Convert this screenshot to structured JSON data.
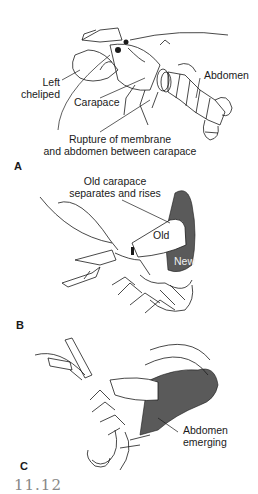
{
  "figure": {
    "number": "11.12",
    "colors": {
      "line": "#1a1a1a",
      "new_shell": "#5a5a5a",
      "background": "#ffffff"
    }
  },
  "panels": [
    {
      "letter": "A",
      "labels": {
        "left_cheliped": [
          "Left",
          "cheliped"
        ],
        "carapace": "Carapace",
        "abdomen": "Abdomen",
        "rupture": [
          "Rupture of membrane",
          "and abdomen between carapace"
        ]
      }
    },
    {
      "letter": "B",
      "labels": {
        "old_carapace": [
          "Old carapace",
          "separates and rises"
        ],
        "old": "Old",
        "new": "New"
      }
    },
    {
      "letter": "C",
      "labels": {
        "abdomen_emerging": [
          "Abdomen",
          "emerging"
        ]
      }
    }
  ]
}
